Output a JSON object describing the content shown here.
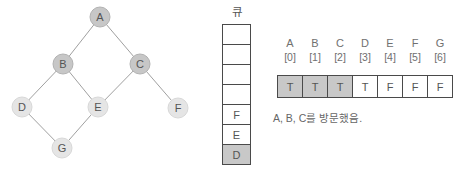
{
  "diagram": {
    "graph": {
      "nodes": [
        {
          "id": "A",
          "x": 100,
          "y": 17,
          "visited": true
        },
        {
          "id": "B",
          "x": 63,
          "y": 64,
          "visited": true
        },
        {
          "id": "C",
          "x": 140,
          "y": 64,
          "visited": true
        },
        {
          "id": "D",
          "x": 22,
          "y": 107,
          "visited": false
        },
        {
          "id": "E",
          "x": 98,
          "y": 107,
          "visited": false
        },
        {
          "id": "F",
          "x": 178,
          "y": 108,
          "visited": false
        },
        {
          "id": "G",
          "x": 62,
          "y": 148,
          "visited": false
        }
      ],
      "edges": [
        [
          "A",
          "B"
        ],
        [
          "A",
          "C"
        ],
        [
          "B",
          "D"
        ],
        [
          "B",
          "E"
        ],
        [
          "C",
          "E"
        ],
        [
          "C",
          "F"
        ],
        [
          "D",
          "G"
        ],
        [
          "E",
          "G"
        ]
      ]
    },
    "queue": {
      "label": "큐",
      "cells": [
        "",
        "",
        "",
        "",
        "F",
        "E",
        "D"
      ],
      "highlight_index": 6
    },
    "visited_array": {
      "columns": [
        {
          "letter": "A",
          "index": "[0]",
          "value": "T",
          "highlight": true
        },
        {
          "letter": "B",
          "index": "[1]",
          "value": "T",
          "highlight": true
        },
        {
          "letter": "C",
          "index": "[2]",
          "value": "T",
          "highlight": true
        },
        {
          "letter": "D",
          "index": "[3]",
          "value": "T",
          "highlight": false
        },
        {
          "letter": "E",
          "index": "[4]",
          "value": "F",
          "highlight": false
        },
        {
          "letter": "F",
          "index": "[5]",
          "value": "F",
          "highlight": false
        },
        {
          "letter": "G",
          "index": "[6]",
          "value": "F",
          "highlight": false
        }
      ],
      "caption": "A, B, C를 방문했음."
    },
    "colors": {
      "visited_node_fill": "#c7c7c7",
      "visited_node_stroke": "#b2b2b2",
      "unvisited_node_fill": "#e5e5e5",
      "unvisited_node_stroke": "#d8d8d8",
      "edge": "#a0a0a0",
      "node_text": "#555555",
      "cell_border": "#4a4a4a",
      "cell_highlight": "#c8c8c8"
    }
  }
}
